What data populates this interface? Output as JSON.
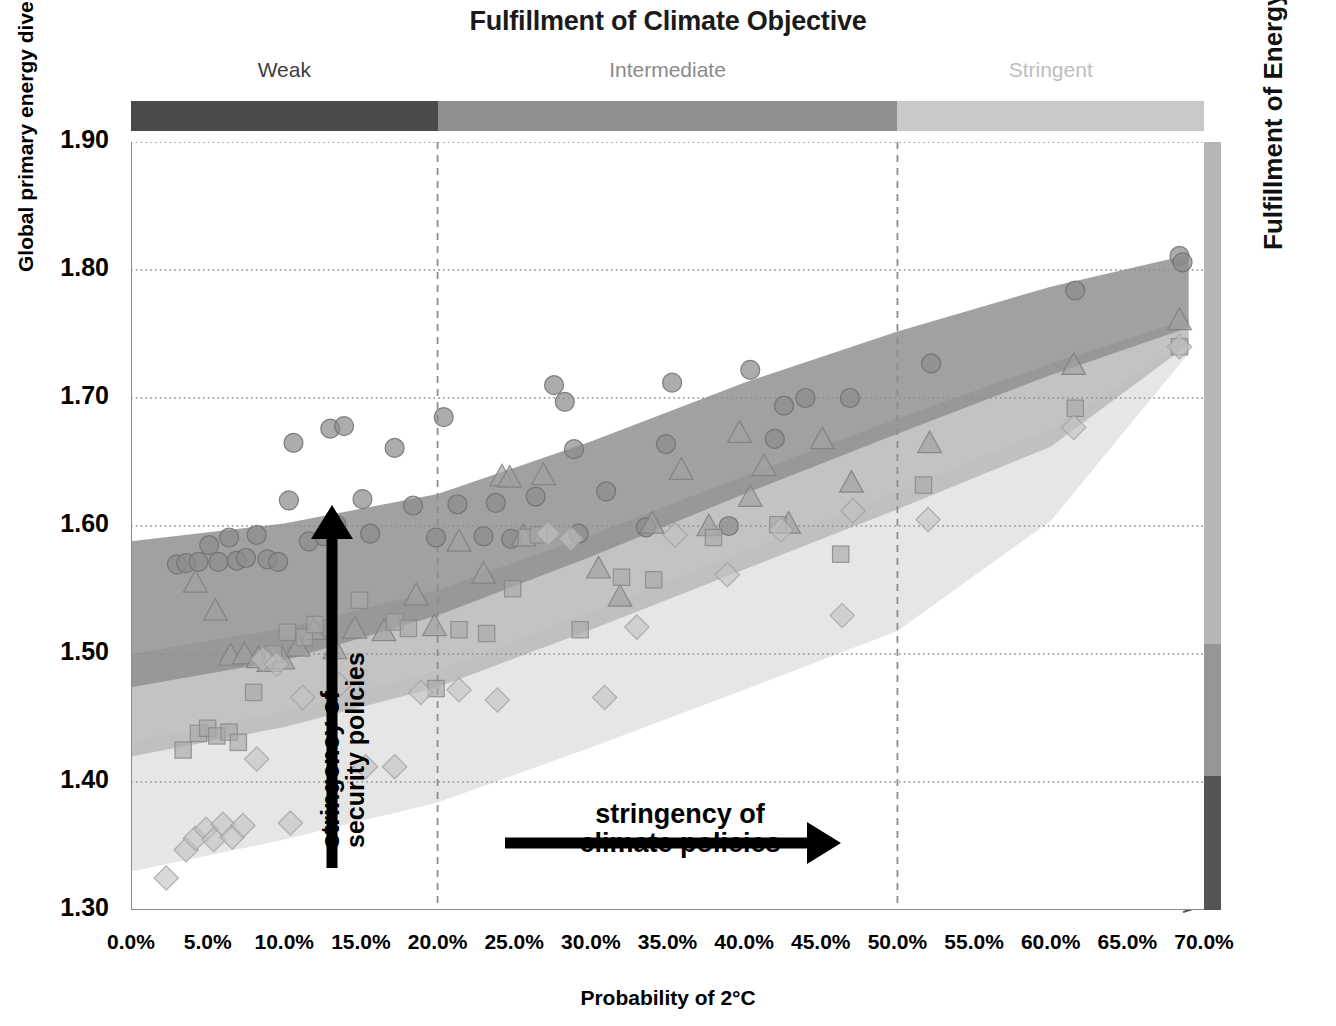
{
  "chart_data": {
    "type": "scatter",
    "title": "Fulfillment of Climate Objective",
    "xlabel": "Probability of 2°C",
    "ylabel": "Global primary energy diversity indicator (I2) in 2030",
    "ylabel_pre": "Global primary energy diversity indicator (I",
    "ylabel_sub": "2",
    "ylabel_post": ") in 2030",
    "right_axis_title": "Fulfillment of Energy Security Objective",
    "xlim": [
      0,
      70
    ],
    "ylim": [
      1.3,
      1.9
    ],
    "xticks": [
      "0.0%",
      "5.0%",
      "10.0%",
      "15.0%",
      "20.0%",
      "25.0%",
      "30.0%",
      "35.0%",
      "40.0%",
      "45.0%",
      "50.0%",
      "55.0%",
      "60.0%",
      "65.0%",
      "70.0%"
    ],
    "xtick_values": [
      0,
      5,
      10,
      15,
      20,
      25,
      30,
      35,
      40,
      45,
      50,
      55,
      60,
      65,
      70
    ],
    "yticks": [
      "1.90",
      "1.80",
      "1.70",
      "1.60",
      "1.50",
      "1.40",
      "1.30"
    ],
    "ytick_values": [
      1.9,
      1.8,
      1.7,
      1.6,
      1.5,
      1.4,
      1.3
    ],
    "grid": "horizontal-dotted",
    "vertical_reference_lines": [
      20,
      50
    ],
    "legend": "none",
    "top_segments": [
      {
        "label": "Weak",
        "x_start": 0,
        "x_end": 20,
        "color": "#4a4a4a",
        "text_color": "#3d3d3d"
      },
      {
        "label": "Intermediate",
        "x_start": 20,
        "x_end": 50,
        "color": "#8f8f8f",
        "text_color": "#8a8a8a"
      },
      {
        "label": "Stringent",
        "x_start": 50,
        "x_end": 70,
        "color": "#c9c9c9",
        "text_color": "#bdbdbd"
      }
    ],
    "right_segments": [
      {
        "label": "Stringent",
        "y_start": 1.5075,
        "y_end": 1.9,
        "color": "#b6b6b6",
        "text_color": "#b9b9b9"
      },
      {
        "label": "Intermediate",
        "y_start": 1.405,
        "y_end": 1.5075,
        "color": "#959595",
        "text_color": "#9a9a9a"
      },
      {
        "label": "Weak",
        "y_start": 1.3,
        "y_end": 1.405,
        "color": "#545454",
        "text_color": "#555"
      }
    ],
    "bands": [
      {
        "name": "stringent-security-band",
        "color": "#909090",
        "opacity": 0.85,
        "upper": [
          [
            0,
            1.588
          ],
          [
            10,
            1.602
          ],
          [
            20,
            1.625
          ],
          [
            30,
            1.666
          ],
          [
            40,
            1.712
          ],
          [
            50,
            1.752
          ],
          [
            60,
            1.787
          ],
          [
            69,
            1.812
          ]
        ],
        "lower": [
          [
            0,
            1.474
          ],
          [
            10,
            1.495
          ],
          [
            20,
            1.53
          ],
          [
            30,
            1.576
          ],
          [
            40,
            1.625
          ],
          [
            50,
            1.672
          ],
          [
            60,
            1.718
          ],
          [
            69,
            1.755
          ]
        ]
      },
      {
        "name": "intermediate-security-band",
        "color": "#b9b9b9",
        "opacity": 0.85,
        "upper": [
          [
            0,
            1.5
          ],
          [
            10,
            1.52
          ],
          [
            20,
            1.55
          ],
          [
            30,
            1.593
          ],
          [
            40,
            1.639
          ],
          [
            50,
            1.684
          ],
          [
            60,
            1.727
          ],
          [
            69,
            1.762
          ]
        ],
        "lower": [
          [
            0,
            1.42
          ],
          [
            10,
            1.443
          ],
          [
            20,
            1.474
          ],
          [
            30,
            1.519
          ],
          [
            40,
            1.566
          ],
          [
            50,
            1.613
          ],
          [
            60,
            1.662
          ],
          [
            69,
            1.742
          ]
        ]
      },
      {
        "name": "weak-security-band",
        "color": "#e3e3e3",
        "opacity": 0.9,
        "upper": [
          [
            0,
            1.432
          ],
          [
            10,
            1.455
          ],
          [
            20,
            1.487
          ],
          [
            30,
            1.533
          ],
          [
            40,
            1.58
          ],
          [
            50,
            1.627
          ],
          [
            60,
            1.676
          ],
          [
            69,
            1.745
          ]
        ],
        "lower": [
          [
            0,
            1.33
          ],
          [
            10,
            1.355
          ],
          [
            20,
            1.384
          ],
          [
            30,
            1.427
          ],
          [
            40,
            1.472
          ],
          [
            50,
            1.518
          ],
          [
            60,
            1.604
          ],
          [
            69,
            1.735
          ]
        ]
      }
    ],
    "series": [
      {
        "name": "circles-stringent-security",
        "marker": "circle",
        "points": [
          [
            3.0,
            1.57
          ],
          [
            3.6,
            1.571
          ],
          [
            4.4,
            1.572
          ],
          [
            5.1,
            1.585
          ],
          [
            5.7,
            1.572
          ],
          [
            6.4,
            1.591
          ],
          [
            6.9,
            1.573
          ],
          [
            7.5,
            1.575
          ],
          [
            8.2,
            1.593
          ],
          [
            8.9,
            1.574
          ],
          [
            9.6,
            1.572
          ],
          [
            10.3,
            1.62
          ],
          [
            10.6,
            1.665
          ],
          [
            11.6,
            1.588
          ],
          [
            12.6,
            1.592
          ],
          [
            13.0,
            1.676
          ],
          [
            13.9,
            1.678
          ],
          [
            13.4,
            1.601
          ],
          [
            15.1,
            1.621
          ],
          [
            15.6,
            1.594
          ],
          [
            17.2,
            1.661
          ],
          [
            18.4,
            1.616
          ],
          [
            19.9,
            1.591
          ],
          [
            20.4,
            1.685
          ],
          [
            21.3,
            1.617
          ],
          [
            23.0,
            1.592
          ],
          [
            23.8,
            1.618
          ],
          [
            24.8,
            1.59
          ],
          [
            26.4,
            1.623
          ],
          [
            27.6,
            1.71
          ],
          [
            28.3,
            1.697
          ],
          [
            28.9,
            1.66
          ],
          [
            29.2,
            1.594
          ],
          [
            31.0,
            1.627
          ],
          [
            33.6,
            1.599
          ],
          [
            34.9,
            1.664
          ],
          [
            35.3,
            1.712
          ],
          [
            39.0,
            1.6
          ],
          [
            40.4,
            1.722
          ],
          [
            42.0,
            1.668
          ],
          [
            42.6,
            1.694
          ],
          [
            44.0,
            1.7
          ],
          [
            46.9,
            1.7
          ],
          [
            52.2,
            1.727
          ],
          [
            61.6,
            1.784
          ],
          [
            68.4,
            1.811
          ],
          [
            68.6,
            1.806
          ]
        ]
      },
      {
        "name": "triangles-intermediate-security",
        "marker": "triangle",
        "points": [
          [
            4.2,
            1.556
          ],
          [
            5.5,
            1.534
          ],
          [
            6.5,
            1.499
          ],
          [
            7.4,
            1.5
          ],
          [
            8.3,
            1.497
          ],
          [
            9.0,
            1.494
          ],
          [
            9.9,
            1.496
          ],
          [
            10.9,
            1.506
          ],
          [
            11.9,
            1.519
          ],
          [
            13.3,
            1.504
          ],
          [
            14.6,
            1.52
          ],
          [
            16.5,
            1.518
          ],
          [
            18.6,
            1.546
          ],
          [
            19.8,
            1.522
          ],
          [
            21.4,
            1.588
          ],
          [
            23.0,
            1.563
          ],
          [
            24.2,
            1.639
          ],
          [
            24.7,
            1.638
          ],
          [
            25.6,
            1.592
          ],
          [
            26.9,
            1.64
          ],
          [
            30.5,
            1.567
          ],
          [
            31.9,
            1.545
          ],
          [
            34.0,
            1.602
          ],
          [
            35.9,
            1.644
          ],
          [
            37.7,
            1.6
          ],
          [
            39.7,
            1.673
          ],
          [
            40.4,
            1.623
          ],
          [
            41.3,
            1.647
          ],
          [
            42.9,
            1.602
          ],
          [
            45.1,
            1.668
          ],
          [
            47.0,
            1.634
          ],
          [
            52.1,
            1.665
          ],
          [
            61.5,
            1.726
          ],
          [
            68.4,
            1.761
          ]
        ]
      },
      {
        "name": "squares-weak-security",
        "marker": "square",
        "points": [
          [
            3.4,
            1.425
          ],
          [
            4.4,
            1.438
          ],
          [
            5.0,
            1.442
          ],
          [
            5.6,
            1.436
          ],
          [
            6.4,
            1.439
          ],
          [
            7.0,
            1.431
          ],
          [
            8.0,
            1.47
          ],
          [
            9.3,
            1.5
          ],
          [
            10.2,
            1.517
          ],
          [
            11.3,
            1.513
          ],
          [
            12.0,
            1.523
          ],
          [
            14.9,
            1.542
          ],
          [
            17.2,
            1.525
          ],
          [
            18.1,
            1.52
          ],
          [
            19.9,
            1.473
          ],
          [
            21.4,
            1.519
          ],
          [
            23.2,
            1.516
          ],
          [
            24.9,
            1.551
          ],
          [
            25.8,
            1.591
          ],
          [
            26.6,
            1.593
          ],
          [
            29.3,
            1.519
          ],
          [
            32.0,
            1.56
          ],
          [
            34.1,
            1.558
          ],
          [
            38.0,
            1.591
          ],
          [
            42.2,
            1.601
          ],
          [
            46.3,
            1.578
          ],
          [
            51.7,
            1.632
          ],
          [
            61.6,
            1.692
          ],
          [
            68.4,
            1.74
          ]
        ]
      },
      {
        "name": "diamonds-weak-security-low",
        "marker": "diamond",
        "points": [
          [
            2.3,
            1.325
          ],
          [
            3.6,
            1.347
          ],
          [
            4.2,
            1.356
          ],
          [
            4.9,
            1.363
          ],
          [
            5.4,
            1.355
          ],
          [
            6.0,
            1.367
          ],
          [
            6.6,
            1.357
          ],
          [
            7.3,
            1.366
          ],
          [
            8.2,
            1.418
          ],
          [
            8.6,
            1.496
          ],
          [
            9.5,
            1.492
          ],
          [
            10.4,
            1.368
          ],
          [
            11.2,
            1.466
          ],
          [
            13.6,
            1.476
          ],
          [
            15.3,
            1.412
          ],
          [
            17.2,
            1.412
          ],
          [
            18.9,
            1.47
          ],
          [
            21.4,
            1.472
          ],
          [
            23.9,
            1.464
          ],
          [
            27.2,
            1.594
          ],
          [
            28.7,
            1.59
          ],
          [
            30.9,
            1.466
          ],
          [
            33.0,
            1.521
          ],
          [
            35.5,
            1.593
          ],
          [
            38.9,
            1.562
          ],
          [
            42.4,
            1.597
          ],
          [
            46.4,
            1.53
          ],
          [
            47.1,
            1.612
          ],
          [
            52.0,
            1.605
          ],
          [
            61.5,
            1.677
          ],
          [
            68.4,
            1.74
          ]
        ]
      }
    ],
    "annotations": [
      {
        "name": "vertical-arrow",
        "text_line1": "stringency of",
        "text_line2": "security policies",
        "direction": "up"
      },
      {
        "name": "horizontal-arrow",
        "text_line1": "stringency of",
        "text_line2": "climate policies",
        "direction": "right"
      }
    ],
    "colors": {
      "band_stringent": "#909090",
      "band_intermediate": "#b9b9b9",
      "band_weak": "#e3e3e3",
      "marker_circle": "#8c8c8c",
      "marker_triangle": "#a0a0a0",
      "marker_square": "#a8a8a8",
      "marker_diamond": "#c2c2c2",
      "axis": "#808080",
      "grid": "#9a9a9a"
    }
  }
}
